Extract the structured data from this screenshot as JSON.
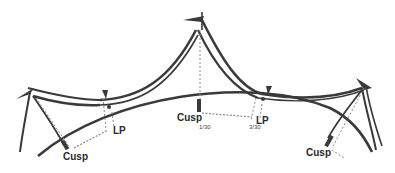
{
  "diagram": {
    "labels": {
      "cusp_left": "Cusp",
      "cusp_center": "Cusp",
      "cusp_right": "Cusp",
      "lp_left": "LP",
      "lp_right": "LP",
      "fraction_center": "1/30",
      "fraction_right": "3/30"
    },
    "colors": {
      "stroke": "#3a3a3a",
      "dashed": "#8a8a8a",
      "background": "#ffffff"
    }
  }
}
